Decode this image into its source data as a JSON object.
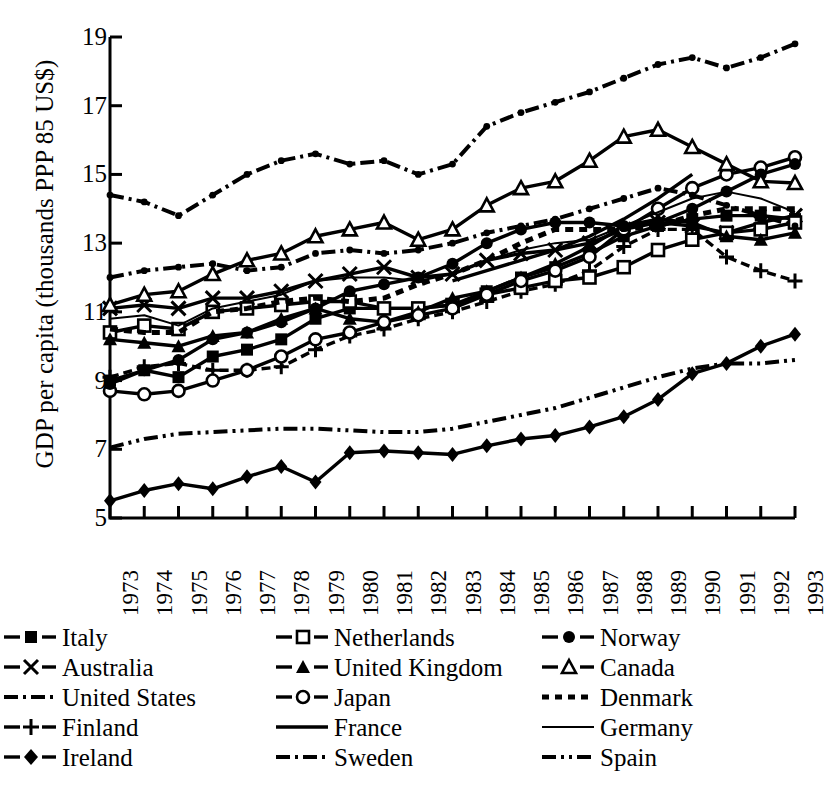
{
  "chart_data": {
    "type": "line",
    "title": "",
    "xlabel": "",
    "ylabel": "GDP per capita (thousands PPP 85 US$)",
    "xlim": [
      1973,
      1993
    ],
    "ylim": [
      5,
      19
    ],
    "yticks": [
      19,
      17,
      15,
      13,
      11,
      9,
      7,
      5
    ],
    "grid": false,
    "legend_position": "bottom",
    "legend_columns": 3,
    "categories": [
      "1973",
      "1974",
      "1975",
      "1976",
      "1977",
      "1978",
      "1979",
      "1980",
      "1981",
      "1982",
      "1983",
      "1984",
      "1985",
      "1986",
      "1987",
      "1988",
      "1989",
      "1990",
      "1991",
      "1992",
      "1993"
    ],
    "x": [
      1973,
      1974,
      1975,
      1976,
      1977,
      1978,
      1979,
      1980,
      1981,
      1982,
      1983,
      1984,
      1985,
      1986,
      1987,
      1988,
      1989,
      1990,
      1991,
      1992,
      1993
    ],
    "series": [
      {
        "name": "Italy",
        "marker": "filled-square",
        "line": "solid",
        "values": [
          9.0,
          9.3,
          9.1,
          9.7,
          9.9,
          10.2,
          10.8,
          11.1,
          11.1,
          11.1,
          11.2,
          11.6,
          12.0,
          12.3,
          12.7,
          13.2,
          13.5,
          13.7,
          13.8,
          13.8,
          13.7
        ]
      },
      {
        "name": "Australia",
        "marker": "cross-x",
        "line": "solid",
        "values": [
          11.1,
          11.2,
          11.1,
          11.4,
          11.4,
          11.6,
          11.9,
          12.1,
          12.3,
          12.0,
          12.1,
          12.5,
          12.7,
          12.8,
          13.0,
          13.4,
          13.6,
          13.5,
          13.3,
          13.6,
          13.8
        ]
      },
      {
        "name": "United States",
        "marker": "small-dot",
        "line": "dash-dot",
        "values": [
          14.4,
          14.2,
          13.8,
          14.4,
          15.0,
          15.4,
          15.6,
          15.3,
          15.4,
          15.0,
          15.3,
          16.4,
          16.8,
          17.1,
          17.4,
          17.8,
          18.2,
          18.4,
          18.1,
          18.4,
          18.8
        ]
      },
      {
        "name": "Finland",
        "marker": "plus",
        "line": "dashed-short",
        "values": [
          9.1,
          9.4,
          9.5,
          9.3,
          9.3,
          9.4,
          9.9,
          10.3,
          10.5,
          10.8,
          11.0,
          11.3,
          11.6,
          11.8,
          12.2,
          12.9,
          13.4,
          13.4,
          12.6,
          12.2,
          11.9
        ]
      },
      {
        "name": "Ireland",
        "marker": "filled-diamond",
        "line": "solid",
        "values": [
          5.5,
          5.8,
          6.0,
          5.85,
          6.2,
          6.5,
          6.05,
          6.9,
          6.95,
          6.9,
          6.85,
          7.1,
          7.3,
          7.4,
          7.65,
          7.95,
          8.45,
          9.2,
          9.5,
          10.0,
          10.35
        ]
      },
      {
        "name": "Netherlands",
        "marker": "open-square",
        "line": "solid",
        "values": [
          10.4,
          10.6,
          10.5,
          11.0,
          11.1,
          11.2,
          11.3,
          11.3,
          11.1,
          11.1,
          11.2,
          11.5,
          11.7,
          11.9,
          12.0,
          12.3,
          12.8,
          13.1,
          13.3,
          13.4,
          13.6
        ]
      },
      {
        "name": "United Kingdom",
        "marker": "filled-triangle",
        "line": "solid",
        "values": [
          10.2,
          10.1,
          10.0,
          10.3,
          10.4,
          10.8,
          11.1,
          10.8,
          10.7,
          11.0,
          11.4,
          11.6,
          12.0,
          12.4,
          12.9,
          13.5,
          13.7,
          13.6,
          13.2,
          13.1,
          13.3
        ]
      },
      {
        "name": "Japan",
        "marker": "open-circle",
        "line": "solid",
        "values": [
          8.7,
          8.6,
          8.7,
          9.0,
          9.3,
          9.7,
          10.2,
          10.4,
          10.7,
          10.9,
          11.1,
          11.5,
          11.9,
          12.2,
          12.6,
          13.4,
          14.0,
          14.6,
          15.0,
          15.2,
          15.5
        ]
      },
      {
        "name": "France",
        "marker": "none",
        "line": "solid",
        "values": [
          null,
          null,
          null,
          null,
          null,
          null,
          null,
          null,
          null,
          null,
          11.9,
          12.2,
          12.5,
          12.8,
          13.2,
          13.7,
          14.3,
          15.0,
          null,
          null,
          null
        ]
      },
      {
        "name": "Sweden",
        "marker": "small-dot",
        "line": "dash-dot",
        "values": [
          12.0,
          12.2,
          12.3,
          12.4,
          12.2,
          12.3,
          12.7,
          12.8,
          12.7,
          12.8,
          13.0,
          13.3,
          13.5,
          13.7,
          14.0,
          14.3,
          14.6,
          14.4,
          14.1,
          13.8,
          13.5
        ]
      },
      {
        "name": "Norway",
        "marker": "filled-circle",
        "line": "solid",
        "values": [
          8.9,
          9.3,
          9.6,
          10.2,
          10.4,
          10.7,
          11.1,
          11.6,
          11.8,
          12.0,
          12.4,
          13.0,
          13.4,
          13.6,
          13.6,
          13.5,
          13.6,
          14.0,
          14.5,
          15.0,
          15.3
        ]
      },
      {
        "name": "Canada",
        "marker": "open-triangle",
        "line": "solid",
        "values": [
          11.2,
          11.5,
          11.6,
          12.1,
          12.5,
          12.7,
          13.2,
          13.4,
          13.6,
          13.1,
          13.4,
          14.1,
          14.6,
          14.8,
          15.4,
          16.1,
          16.3,
          15.8,
          15.3,
          14.8,
          14.75
        ]
      },
      {
        "name": "Denmark",
        "marker": "none",
        "line": "dotted",
        "values": [
          10.5,
          10.4,
          10.4,
          11.0,
          11.1,
          11.3,
          11.4,
          11.3,
          11.4,
          11.8,
          12.1,
          12.5,
          13.0,
          13.4,
          13.4,
          13.4,
          13.5,
          13.8,
          14.0,
          14.0,
          14.0
        ]
      },
      {
        "name": "Germany",
        "marker": "none",
        "line": "solid-thin",
        "values": [
          10.8,
          10.9,
          10.6,
          11.1,
          11.3,
          11.5,
          11.9,
          12.0,
          12.0,
          11.9,
          12.1,
          12.5,
          12.8,
          13.0,
          13.1,
          13.5,
          13.9,
          14.3,
          14.5,
          14.3,
          13.9
        ]
      },
      {
        "name": "Spain",
        "marker": "none",
        "line": "dash-dot-dot",
        "values": [
          7.05,
          7.3,
          7.45,
          7.5,
          7.55,
          7.6,
          7.6,
          7.55,
          7.5,
          7.5,
          7.6,
          7.8,
          8.0,
          8.2,
          8.5,
          8.8,
          9.1,
          9.35,
          9.5,
          9.5,
          9.6
        ]
      }
    ]
  },
  "legend": {
    "columns": [
      [
        {
          "label": "Italy",
          "key": "filled-square-key"
        },
        {
          "label": "Australia",
          "key": "cross-x-key"
        },
        {
          "label": "United States",
          "key": "dash-dot-key"
        },
        {
          "label": "Finland",
          "key": "plus-key"
        },
        {
          "label": "Ireland",
          "key": "filled-diamond-key"
        }
      ],
      [
        {
          "label": "Netherlands",
          "key": "open-square-key"
        },
        {
          "label": "United Kingdom",
          "key": "filled-triangle-key"
        },
        {
          "label": "Japan",
          "key": "open-circle-key"
        },
        {
          "label": "France",
          "key": "solid-line-key"
        },
        {
          "label": "Sweden",
          "key": "dash-dot-key"
        }
      ],
      [
        {
          "label": "Norway",
          "key": "filled-circle-key"
        },
        {
          "label": "Canada",
          "key": "open-triangle-key"
        },
        {
          "label": "Denmark",
          "key": "dotted-key"
        },
        {
          "label": "Germany",
          "key": "solid-thin-key"
        },
        {
          "label": "Spain",
          "key": "dash-dot-dot-key"
        }
      ]
    ]
  }
}
